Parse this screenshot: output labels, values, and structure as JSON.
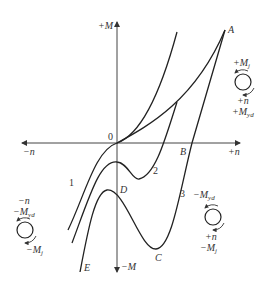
{
  "diagram": {
    "type": "torque-speed characteristic curves",
    "axes": {
      "x_positive": "+n",
      "x_negative": "−n",
      "y_positive": "+M",
      "y_negative": "−M",
      "origin": "0"
    },
    "curves": [
      {
        "id": "1",
        "label": "1"
      },
      {
        "id": "2",
        "label": "2"
      },
      {
        "id": "3",
        "label": "3"
      }
    ],
    "points": {
      "A": "A",
      "B": "B",
      "C": "C",
      "D": "D",
      "E": "E"
    },
    "quadrant_annotations": {
      "upper_right": {
        "top": "+M",
        "top_sub": "j",
        "mid": "+n",
        "bottom": "+M",
        "bottom_sub": "yd"
      },
      "lower_left": {
        "top": "−n",
        "mid": "−M",
        "mid_sub": "yd",
        "bottom": "−M",
        "bottom_sub": "j"
      },
      "lower_right": {
        "top": "−M",
        "top_sub": "yd",
        "mid": "+n",
        "bottom": "−M",
        "bottom_sub": "j"
      }
    },
    "colors": {
      "line": "#222222",
      "axis": "#333333",
      "background": "#ffffff"
    }
  }
}
